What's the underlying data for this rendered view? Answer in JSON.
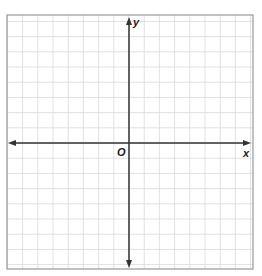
{
  "diagram": {
    "type": "coordinate-grid",
    "x_axis_label": "x",
    "y_axis_label": "y",
    "origin_label": "O",
    "grid_columns": 16,
    "grid_rows": 17,
    "colors": {
      "grid": "#d9d9d9",
      "frame": "#9a9a9a",
      "axis": "#333333"
    }
  }
}
